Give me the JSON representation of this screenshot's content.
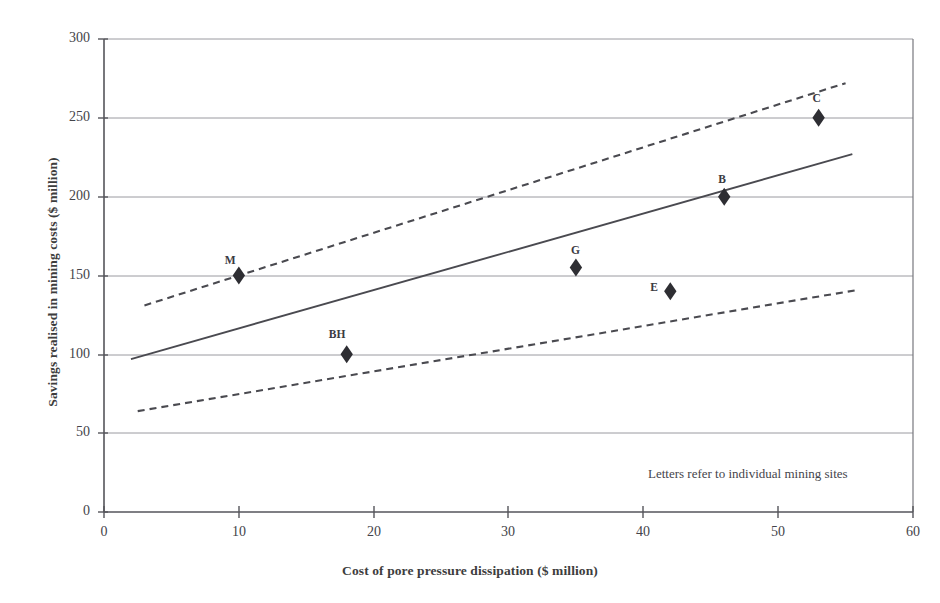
{
  "chart_data": {
    "type": "scatter",
    "title": "",
    "xlabel": "Cost of pore pressure dissipation ($ million)",
    "ylabel": "Savings realised in mining costs ($ million)",
    "xlim": [
      0,
      60
    ],
    "ylim": [
      0,
      300
    ],
    "xticks": [
      0,
      10,
      20,
      30,
      40,
      50,
      60
    ],
    "yticks": [
      0,
      50,
      100,
      150,
      200,
      250,
      300
    ],
    "xtick_labels": [
      "0",
      "10",
      "20",
      "30",
      "40",
      "50",
      "60"
    ],
    "ytick_labels": [
      "0",
      "50",
      "100",
      "150",
      "200",
      "250",
      "300"
    ],
    "grid": "horizontal",
    "legend": "none",
    "annotation": "Letters refer to individual mining sites",
    "points": [
      {
        "label": "M",
        "x": 10,
        "y": 150
      },
      {
        "label": "BH",
        "x": 18,
        "y": 100
      },
      {
        "label": "G",
        "x": 35,
        "y": 155
      },
      {
        "label": "E",
        "x": 42,
        "y": 140
      },
      {
        "label": "B",
        "x": 46,
        "y": 200
      },
      {
        "label": "C",
        "x": 53,
        "y": 250
      }
    ],
    "series": [
      {
        "name": "trend-line",
        "style": "solid",
        "x": [
          2,
          55.5
        ],
        "values": [
          97,
          227
        ]
      },
      {
        "name": "upper-confidence-band",
        "style": "dashed",
        "x": [
          3,
          55
        ],
        "values": [
          131,
          272
        ]
      },
      {
        "name": "lower-confidence-band",
        "style": "dashed",
        "x": [
          2.5,
          56
        ],
        "values": [
          64,
          141
        ]
      }
    ],
    "colors": {
      "axis": "#5a5a5f",
      "grid": "#8e8e94",
      "marker": "#2e2e33",
      "line": "#4a4a50",
      "text": "#3d3d3d"
    }
  }
}
